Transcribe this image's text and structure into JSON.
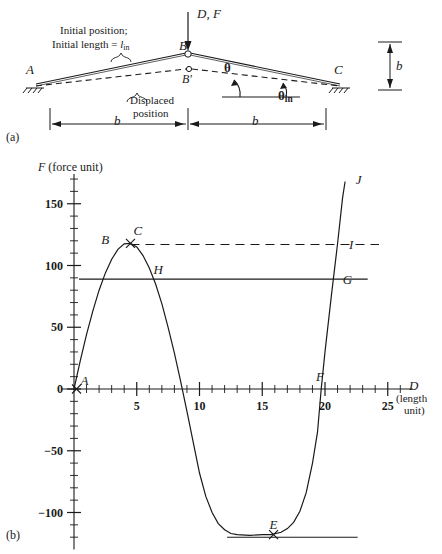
{
  "figure": {
    "panel_a_label": "(a)",
    "panel_b_label": "(b)"
  },
  "panel_a": {
    "title_note_line1": "Initial position;",
    "title_note_line2_pre": "Initial length = ",
    "title_note_line2_sym": "l",
    "title_note_line2_sub": "in",
    "displaced_line1": "Displaced",
    "displaced_line2": "position",
    "load_label": "D, F",
    "node_a": "A",
    "node_b": "B",
    "node_b_prime": "B′",
    "node_c": "C",
    "angle_theta": "θ",
    "angle_theta_in_sym": "θ",
    "angle_theta_in_sub": "in",
    "dim_b_left": "b",
    "dim_b_right": "b",
    "dim_b_vertical": "b"
  },
  "chart_data": {
    "type": "line",
    "title": "",
    "xlabel_sym": "D",
    "xlabel_unit_line1": "(length",
    "xlabel_unit_line2": "unit)",
    "ylabel_sym": "F",
    "ylabel_unit": "(force unit)",
    "xlim": [
      -1,
      27
    ],
    "ylim": [
      -130,
      170
    ],
    "x_ticks_major": [
      5,
      10,
      15,
      20,
      25
    ],
    "x_tick_labels": [
      "5",
      "10",
      "15",
      "20",
      "25"
    ],
    "x_tick_minor_step": 1,
    "y_ticks_major": [
      -100,
      -50,
      0,
      50,
      100,
      150
    ],
    "y_tick_labels": [
      "−100",
      "−50",
      "0",
      "50",
      "100",
      "150"
    ],
    "y_tick_minor_step": 10,
    "grid": false,
    "legend": false,
    "series": [
      {
        "name": "force-displacement curve",
        "style": "solid",
        "points": [
          [
            0,
            0
          ],
          [
            0.5,
            23
          ],
          [
            1,
            44
          ],
          [
            1.5,
            63
          ],
          [
            2,
            80
          ],
          [
            2.5,
            94
          ],
          [
            3,
            105
          ],
          [
            3.5,
            113
          ],
          [
            4,
            117.5
          ],
          [
            4.5,
            118
          ],
          [
            5,
            115
          ],
          [
            5.5,
            108
          ],
          [
            6,
            98
          ],
          [
            6.5,
            85
          ],
          [
            7,
            69
          ],
          [
            7.5,
            50
          ],
          [
            8,
            29
          ],
          [
            8.5,
            6
          ],
          [
            9,
            -18
          ],
          [
            9.5,
            -43
          ],
          [
            10,
            -68
          ],
          [
            10.5,
            -87
          ],
          [
            11,
            -100
          ],
          [
            11.5,
            -109
          ],
          [
            12,
            -114
          ],
          [
            12.5,
            -117
          ],
          [
            13,
            -118
          ],
          [
            14,
            -118.5
          ],
          [
            15,
            -118
          ],
          [
            15.7,
            -118
          ],
          [
            16.5,
            -116
          ],
          [
            17,
            -113
          ],
          [
            17.5,
            -108
          ],
          [
            18,
            -99
          ],
          [
            18.5,
            -84
          ],
          [
            19,
            -60
          ],
          [
            19.4,
            -35
          ],
          [
            19.7,
            0
          ],
          [
            20,
            30
          ],
          [
            20.5,
            75
          ],
          [
            21,
            118
          ],
          [
            21.4,
            155
          ],
          [
            21.6,
            168
          ]
        ]
      },
      {
        "name": "dashed reference level",
        "style": "dashed",
        "y_value": 117,
        "x_from": 4.5,
        "x_to": 24.3
      },
      {
        "name": "solid reference level",
        "style": "solid",
        "y_value": 89,
        "x_from": 0.4,
        "x_to": 23.4
      },
      {
        "name": "bottom tangent level",
        "style": "solid",
        "y_value": -120,
        "x_from": 12.2,
        "x_to": 22.6
      }
    ],
    "annotations": [
      {
        "label": "A",
        "x": 0.2,
        "y": 0,
        "marker": "x"
      },
      {
        "label": "B",
        "x": 3.2,
        "y": 114,
        "marker": "none"
      },
      {
        "label": "C",
        "x": 4.5,
        "y": 118,
        "marker": "x"
      },
      {
        "label": "H",
        "x": 6.1,
        "y": 89,
        "marker": "none"
      },
      {
        "label": "E",
        "x": 15.9,
        "y": -118,
        "marker": "x"
      },
      {
        "label": "F",
        "x": 19.6,
        "y": 0,
        "marker": "none"
      },
      {
        "label": "G",
        "x": 20.7,
        "y": 89,
        "marker": "none"
      },
      {
        "label": "I",
        "x": 21.2,
        "y": 117,
        "marker": "none"
      },
      {
        "label": "J",
        "x": 21.9,
        "y": 164,
        "marker": "none"
      }
    ]
  }
}
